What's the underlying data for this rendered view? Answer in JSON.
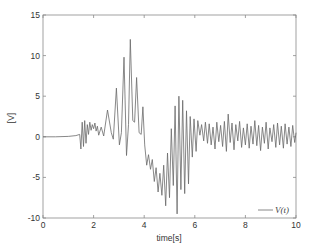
{
  "chart_data": {
    "type": "line",
    "title": "",
    "xlabel": "time[s]",
    "ylabel": "[V]",
    "xlim": [
      0,
      10
    ],
    "ylim": [
      -10,
      15
    ],
    "xticks": [
      0,
      2,
      4,
      6,
      8,
      10
    ],
    "yticks": [
      -10,
      -5,
      0,
      5,
      10,
      15
    ],
    "xtick_labels": [
      "0",
      "2",
      "4",
      "6",
      "8",
      "10"
    ],
    "ytick_labels": [
      "-10",
      "-5",
      "0",
      "5",
      "10",
      "15"
    ],
    "grid": false,
    "legend_position": "bottom-right",
    "line_color": "#6a6a6a",
    "series": [
      {
        "name": "V(t)",
        "x": [
          0,
          0.5,
          1.0,
          1.3,
          1.45,
          1.5,
          1.55,
          1.6,
          1.65,
          1.7,
          1.75,
          1.8,
          1.85,
          1.9,
          1.95,
          2.0,
          2.05,
          2.1,
          2.15,
          2.2,
          2.3,
          2.4,
          2.55,
          2.7,
          2.78,
          2.9,
          3.02,
          3.1,
          3.2,
          3.3,
          3.38,
          3.45,
          3.55,
          3.62,
          3.7,
          3.8,
          3.88,
          3.95,
          4.02,
          4.1,
          4.17,
          4.25,
          4.32,
          4.4,
          4.47,
          4.55,
          4.62,
          4.7,
          4.77,
          4.85,
          4.92,
          5.0,
          5.07,
          5.15,
          5.22,
          5.3,
          5.37,
          5.45,
          5.52,
          5.6,
          5.67,
          5.75,
          5.82,
          5.9,
          5.97,
          6.05,
          6.12,
          6.2,
          6.27,
          6.35,
          6.42,
          6.5,
          6.57,
          6.65,
          6.72,
          6.8,
          6.87,
          6.95,
          7.02,
          7.1,
          7.17,
          7.25,
          7.32,
          7.4,
          7.47,
          7.55,
          7.62,
          7.7,
          7.77,
          7.85,
          7.92,
          8.0,
          8.07,
          8.15,
          8.22,
          8.3,
          8.37,
          8.45,
          8.52,
          8.6,
          8.67,
          8.75,
          8.82,
          8.9,
          8.97,
          9.05,
          9.12,
          9.2,
          9.27,
          9.35,
          9.42,
          9.5,
          9.57,
          9.65,
          9.72,
          9.8,
          9.87,
          9.95,
          10.0
        ],
        "y": [
          0,
          0,
          0.05,
          0.15,
          0.3,
          -1.5,
          1.8,
          -1.2,
          2.0,
          -0.8,
          1.5,
          0.3,
          1.8,
          0.8,
          1.5,
          1.0,
          1.7,
          0.7,
          1.3,
          0.2,
          1.2,
          0.1,
          3.3,
          0.5,
          -0.3,
          6.0,
          -1.0,
          0.5,
          9.8,
          -2.3,
          1.5,
          12.0,
          2.0,
          1.8,
          7.3,
          0.5,
          0.3,
          3.7,
          -1.0,
          -3.5,
          -2.2,
          -4.0,
          -2.8,
          -5.5,
          -3.8,
          -6.8,
          -4.5,
          -7.2,
          -3.5,
          -8.5,
          -2.0,
          -7.5,
          1.0,
          -6.0,
          3.8,
          -9.5,
          5.0,
          -6.5,
          4.5,
          -7.0,
          3.2,
          -5.8,
          2.5,
          -2.5,
          2.2,
          -1.8,
          2.0,
          0.2,
          1.5,
          -0.5,
          1.8,
          -0.8,
          1.6,
          -1.0,
          1.2,
          -1.5,
          1.8,
          -0.6,
          1.4,
          -1.2,
          1.9,
          -1.8,
          2.8,
          -0.7,
          1.7,
          -1.6,
          1.5,
          -0.5,
          1.9,
          -1.3,
          1.1,
          -1.0,
          1.6,
          -1.4,
          1.3,
          -0.9,
          2.0,
          -1.1,
          1.4,
          -1.7,
          1.2,
          -0.8,
          1.8,
          -1.5,
          1.1,
          -0.6,
          1.5,
          -1.3,
          1.7,
          -1.0,
          1.3,
          -1.4,
          1.6,
          -0.9,
          1.2,
          -1.2,
          1.4,
          -0.7,
          0.5
        ]
      }
    ]
  }
}
